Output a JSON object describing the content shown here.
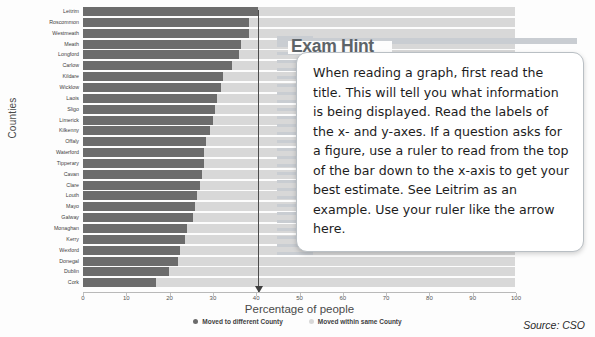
{
  "chart_data": {
    "type": "bar",
    "orientation": "horizontal",
    "stacked": true,
    "title": "",
    "xlabel": "Percentage of people",
    "ylabel": "Counties",
    "xlim": [
      0,
      100
    ],
    "xticks": [
      0,
      10,
      20,
      30,
      40,
      50,
      60,
      70,
      80,
      90,
      100
    ],
    "grid": false,
    "legend_position": "bottom",
    "categories": [
      "Leitrim",
      "Roscommon",
      "Westmeath",
      "Meath",
      "Longford",
      "Carlow",
      "Kildare",
      "Wicklow",
      "Laois",
      "Sligo",
      "Limerick",
      "Kilkenny",
      "Offaly",
      "Waterford",
      "Tipperary",
      "Cavan",
      "Clare",
      "Louth",
      "Mayo",
      "Galway",
      "Monaghan",
      "Kerry",
      "Wexford",
      "Donegal",
      "Dublin",
      "Cork"
    ],
    "series": [
      {
        "name": "Moved to different County",
        "color": "#6c6c6c",
        "values": [
          40.5,
          38.5,
          38.5,
          36.5,
          36.0,
          34.5,
          32.5,
          32.0,
          31.0,
          30.5,
          30.0,
          29.5,
          28.5,
          28.0,
          28.0,
          27.5,
          27.0,
          26.5,
          26.0,
          25.5,
          24.0,
          23.5,
          22.5,
          22.0,
          20.0,
          17.0
        ]
      },
      {
        "name": "Moved within same County",
        "color": "#d8d8d8",
        "values": [
          59.5,
          61.5,
          61.5,
          63.5,
          64.0,
          65.5,
          67.5,
          68.0,
          69.0,
          69.5,
          70.0,
          70.5,
          71.5,
          72.0,
          72.0,
          72.5,
          73.0,
          73.5,
          74.0,
          74.5,
          76.0,
          76.5,
          77.5,
          78.0,
          80.0,
          83.0
        ]
      }
    ],
    "annotations": [
      {
        "name": "ruler-arrow",
        "type": "vertical-arrow",
        "x_value": 40.5,
        "note": "Ruler line dropped from top of Leitrim bar down to the x-axis"
      }
    ]
  },
  "hint": {
    "title": "Exam Hint",
    "body": "When reading a graph, first read the title. This will tell you what information is being displayed. Read the labels of the x- and y-axes. If a question asks for a figure, use a ruler to read from the top of the bar down to the x-axis to get your best estimate. See Leitrim as an example. Use your ruler like the arrow here."
  },
  "source": "Source: CSO"
}
